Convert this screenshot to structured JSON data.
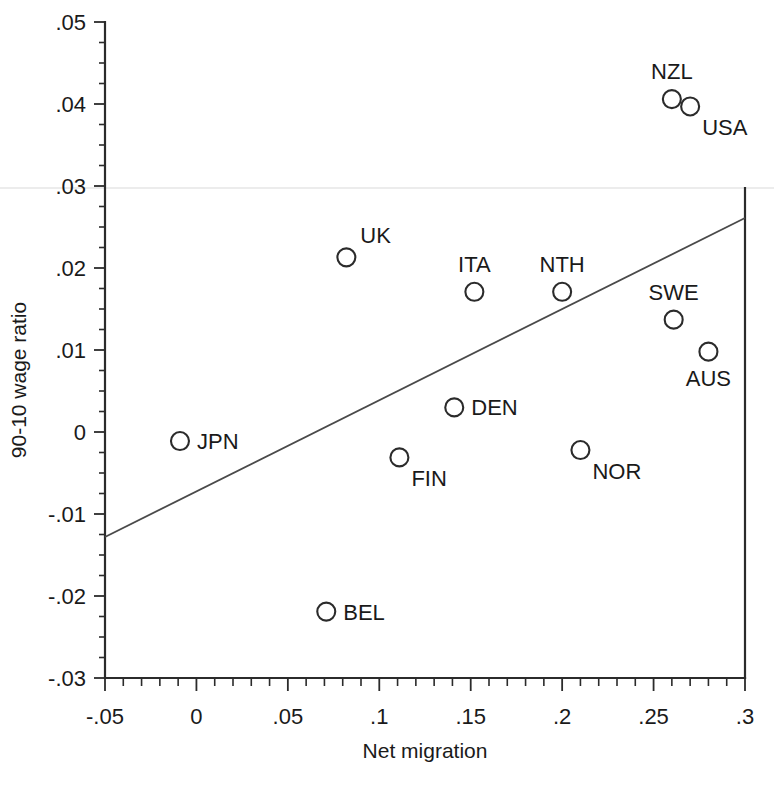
{
  "chart_data": {
    "type": "scatter",
    "title": "",
    "xlabel": "Net migration",
    "ylabel": "90-10 wage ratio",
    "xlim": [
      -0.05,
      0.3
    ],
    "ylim": [
      -0.03,
      0.05
    ],
    "grid": false,
    "legend": "none",
    "x_ticks": [
      "-.05",
      "0",
      ".05",
      ".1",
      ".15",
      ".2",
      ".25",
      ".3"
    ],
    "x_tick_values": [
      -0.05,
      0,
      0.05,
      0.1,
      0.15,
      0.2,
      0.25,
      0.3
    ],
    "x_minor_step": 0.01,
    "y_ticks": [
      ".05",
      ".04",
      ".03",
      ".02",
      ".01",
      "0",
      "-.01",
      "-.02",
      "-.03"
    ],
    "y_tick_values": [
      0.05,
      0.04,
      0.03,
      0.02,
      0.01,
      0,
      -0.01,
      -0.02,
      -0.03
    ],
    "y_minor_step": 0.0025,
    "points": [
      {
        "label": "NZL",
        "x": 0.26,
        "y": 0.0406,
        "label_pos": "above"
      },
      {
        "label": "USA",
        "x": 0.27,
        "y": 0.0397,
        "label_pos": "below-right"
      },
      {
        "label": "UK",
        "x": 0.082,
        "y": 0.0213,
        "label_pos": "above-right"
      },
      {
        "label": "ITA",
        "x": 0.152,
        "y": 0.0171,
        "label_pos": "above"
      },
      {
        "label": "NTH",
        "x": 0.2,
        "y": 0.0171,
        "label_pos": "above"
      },
      {
        "label": "SWE",
        "x": 0.261,
        "y": 0.0137,
        "label_pos": "above"
      },
      {
        "label": "AUS",
        "x": 0.28,
        "y": 0.0098,
        "label_pos": "below"
      },
      {
        "label": "DEN",
        "x": 0.141,
        "y": 0.003,
        "label_pos": "right"
      },
      {
        "label": "JPN",
        "x": -0.009,
        "y": -0.0011,
        "label_pos": "right"
      },
      {
        "label": "NOR",
        "x": 0.21,
        "y": -0.0022,
        "label_pos": "below-right"
      },
      {
        "label": "FIN",
        "x": 0.111,
        "y": -0.0031,
        "label_pos": "below-right"
      },
      {
        "label": "BEL",
        "x": 0.071,
        "y": -0.0219,
        "label_pos": "right"
      }
    ],
    "fit_line": {
      "x_start": -0.05,
      "y_start": -0.0128,
      "x_end": 0.3,
      "y_end": 0.0261,
      "slope": 0.1111,
      "intercept": -0.0073
    },
    "marker_style": {
      "shape": "circle-open",
      "radius_px": 9,
      "stroke": "#2b2b2b"
    },
    "colors": {
      "ink": "#2b2b2b",
      "text": "#1a1a1a",
      "line": "#4a4a4a",
      "background": "#ffffff"
    }
  }
}
